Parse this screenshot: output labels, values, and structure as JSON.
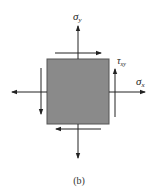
{
  "diagram": {
    "caption": "(b)",
    "element": {
      "fill": "#8a8a8a",
      "stroke": "#555555"
    },
    "stroke_color": "#222222",
    "labels": {
      "sigma_y": {
        "symbol": "σ",
        "sub": "y"
      },
      "sigma_x": {
        "symbol": "σ",
        "sub": "x"
      },
      "tau_xy": {
        "symbol": "τ",
        "sub": "xy"
      }
    },
    "arrows": [
      {
        "name": "normal-stress-top",
        "direction": "up"
      },
      {
        "name": "normal-stress-bottom",
        "direction": "down"
      },
      {
        "name": "normal-stress-right",
        "direction": "right"
      },
      {
        "name": "normal-stress-left",
        "direction": "left"
      },
      {
        "name": "shear-stress-top",
        "direction": "right"
      },
      {
        "name": "shear-stress-bottom",
        "direction": "left"
      },
      {
        "name": "shear-stress-right",
        "direction": "up"
      },
      {
        "name": "shear-stress-left",
        "direction": "down"
      }
    ]
  }
}
